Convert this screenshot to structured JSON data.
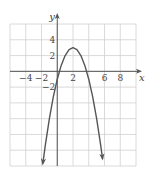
{
  "chart_data": {
    "type": "line",
    "title": "",
    "xlabel": "x",
    "ylabel": "y",
    "xlim": [
      -6,
      10
    ],
    "ylim": [
      -12,
      6
    ],
    "grid": true,
    "grid_step": 2,
    "x_tick_labels": [
      "-4",
      "-2",
      "2",
      "6",
      "8"
    ],
    "x_tick_values": [
      -4,
      -2,
      2,
      6,
      8
    ],
    "y_tick_labels": [
      "4",
      "2",
      "-2"
    ],
    "y_tick_values": [
      4,
      2,
      -2
    ],
    "series": [
      {
        "name": "parabola",
        "equation": "y = -x^2 + 4x - 1",
        "vertex": [
          2,
          3
        ],
        "x_intercepts": [
          0.27,
          3.73
        ],
        "x": [
          -1.83,
          -1.5,
          -1,
          -0.5,
          0,
          0.5,
          1,
          1.5,
          2,
          2.5,
          3,
          3.5,
          4,
          4.5,
          5,
          5.5,
          5.75
        ],
        "y": [
          -11.67,
          -9.25,
          -6,
          -3.25,
          -1,
          0.75,
          2,
          2.75,
          3,
          2.75,
          2,
          0.75,
          -1,
          -3.25,
          -6,
          -9.25,
          -11.06
        ],
        "arrows_at_ends": true
      }
    ],
    "legend": null
  },
  "colors": {
    "grid": "#d0d0d0",
    "axis": "#555555",
    "curve": "#555555",
    "text": "#444444"
  }
}
